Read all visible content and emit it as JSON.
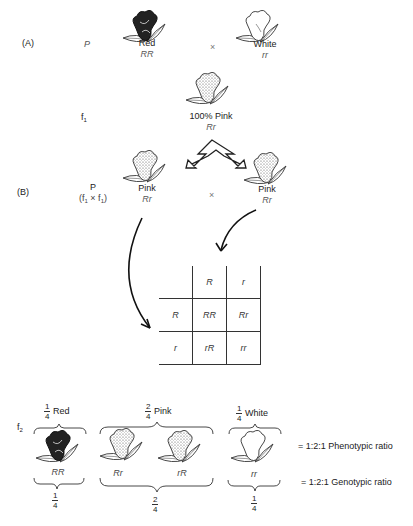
{
  "panel_a": {
    "label": "(A)",
    "generation": "P",
    "parent1": {
      "phenotype": "Red",
      "genotype": "RR",
      "flower_color": "red"
    },
    "cross_symbol": "×",
    "parent2": {
      "phenotype": "White",
      "genotype": "rr",
      "flower_color": "white"
    },
    "f1_label": "f",
    "f1_sub": "1",
    "f1_result": {
      "phenotype": "100% Pink",
      "genotype": "Rr",
      "flower_color": "pink"
    }
  },
  "panel_b": {
    "label": "(B)",
    "generation": "P",
    "cross_note_pre": "(f",
    "cross_note_sub1": "1",
    "cross_note_mid": " × f",
    "cross_note_sub2": "1",
    "cross_note_post": ")",
    "parent1": {
      "phenotype": "Pink",
      "genotype": "Rr"
    },
    "cross_symbol": "×",
    "parent2": {
      "phenotype": "Pink",
      "genotype": "Rr"
    }
  },
  "punnett": {
    "col_headers": [
      "R",
      "r"
    ],
    "rows": [
      {
        "header": "R",
        "cells": [
          "RR",
          "Rr"
        ]
      },
      {
        "header": "r",
        "cells": [
          "rR",
          "rr"
        ]
      }
    ]
  },
  "f2": {
    "label": "f",
    "label_sub": "2",
    "groups": [
      {
        "frac_num": "1",
        "frac_den": "4",
        "phenotype": "Red",
        "genotypes": [
          "RR"
        ],
        "bottom_num": "1",
        "bottom_den": "4"
      },
      {
        "frac_num": "2",
        "frac_den": "4",
        "phenotype": "Pink",
        "genotypes": [
          "Rr",
          "rR"
        ],
        "bottom_num": "2",
        "bottom_den": "4"
      },
      {
        "frac_num": "1",
        "frac_den": "4",
        "phenotype": "White",
        "genotypes": [
          "rr"
        ],
        "bottom_num": "1",
        "bottom_den": "4"
      }
    ],
    "phenotypic_ratio": "= 1:2:1 Phenotypic ratio",
    "genotypic_ratio": "= 1:2:1 Genotypic ratio"
  }
}
